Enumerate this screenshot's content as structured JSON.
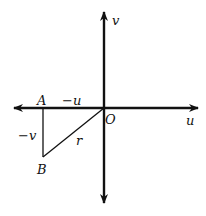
{
  "diagram": {
    "type": "coordinate-plane-triangle",
    "axes": {
      "horizontal_label": "u",
      "vertical_label": "v",
      "origin_label": "O"
    },
    "points": {
      "A": "A",
      "B": "B"
    },
    "segments": {
      "AO_label": "−u",
      "AB_label": "−v",
      "BO_label": "r"
    },
    "colors": {
      "stroke": "#111111",
      "background": "#ffffff"
    }
  }
}
